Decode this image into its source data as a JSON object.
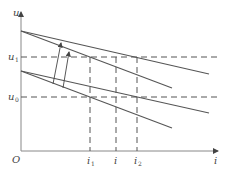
{
  "diagram": {
    "type": "voltage-current characteristic diagram",
    "axes": {
      "y_label": "u",
      "x_label": "i",
      "origin_label": "O"
    },
    "y_levels": [
      {
        "name": "u1",
        "label": "u",
        "subscript": "1"
      },
      {
        "name": "u0",
        "label": "u",
        "subscript": "0"
      }
    ],
    "x_marks": [
      {
        "name": "i1",
        "label": "i",
        "subscript": "1"
      },
      {
        "name": "i",
        "label": "i",
        "subscript": ""
      },
      {
        "name": "i2",
        "label": "i",
        "subscript": "2"
      }
    ],
    "lines": {
      "upper_pair": [
        "upper shallow characteristic",
        "upper steep characteristic"
      ],
      "lower_pair": [
        "lower shallow characteristic",
        "lower steep characteristic"
      ],
      "arrows": [
        "shift arrow 1",
        "shift arrow 2"
      ]
    },
    "colors": {
      "line": "#555555",
      "dash": "#555555",
      "axis": "#888888",
      "text": "#444444"
    }
  }
}
